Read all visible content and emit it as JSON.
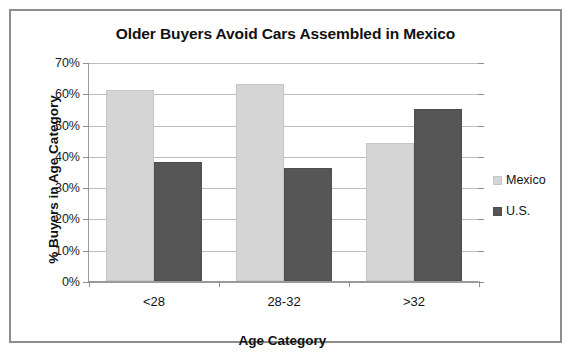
{
  "chart_data": {
    "type": "bar",
    "title": "Older Buyers Avoid Cars Assembled in Mexico",
    "xlabel": "Age Category",
    "ylabel": "% Buyers in Age Category",
    "categories": [
      "<28",
      "28-32",
      ">32"
    ],
    "series": [
      {
        "name": "Mexico",
        "color": "#d5d5d5",
        "values": [
          61,
          63,
          44
        ]
      },
      {
        "name": "U.S.",
        "color": "#565656",
        "values": [
          38,
          36,
          55
        ]
      }
    ],
    "ylim": [
      0,
      70
    ],
    "ytick_values": [
      0,
      10,
      20,
      30,
      40,
      50,
      60,
      70
    ],
    "ytick_labels": [
      "0%",
      "10%",
      "20%",
      "30%",
      "40%",
      "50%",
      "60%",
      "70%"
    ],
    "grid": true,
    "legend_position": "right",
    "value_suffix": "%"
  }
}
